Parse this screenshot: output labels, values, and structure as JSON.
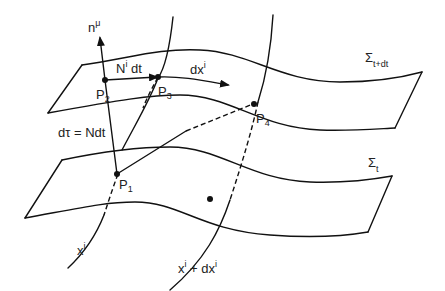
{
  "figure": {
    "surfaces": {
      "upper": {
        "label": "Σ",
        "subscript": "t+dt"
      },
      "lower": {
        "label": "Σ",
        "subscript": "t"
      }
    },
    "points": {
      "p1": {
        "label": "P",
        "subscript": "1"
      },
      "p2": {
        "label": "P",
        "subscript": "2"
      },
      "p3": {
        "label": "P",
        "subscript": "3"
      },
      "p4": {
        "label": "P",
        "subscript": "4"
      }
    },
    "vectors": {
      "normal": {
        "label": "n",
        "superscript": "μ"
      },
      "shift": {
        "label": "N",
        "superscript": "i",
        "suffix": " dt"
      },
      "displacement": {
        "label": "dx",
        "superscript": "i"
      }
    },
    "proper_time": {
      "label": "dτ = Ndt"
    },
    "coordinate_lines": {
      "left": {
        "label": "x",
        "superscript": "i"
      },
      "right": {
        "label": "x",
        "superscript": "i",
        "suffix": " + dx",
        "suffix_sup": "i"
      }
    }
  }
}
